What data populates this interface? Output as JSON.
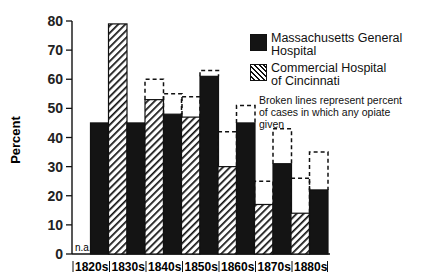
{
  "chart_data": {
    "type": "bar",
    "title": "",
    "xlabel": "",
    "ylabel": "Percent",
    "ylim": [
      0,
      80
    ],
    "yticks": [
      0,
      10,
      20,
      30,
      40,
      50,
      60,
      70,
      80
    ],
    "grid": false,
    "legend_position": "upper right",
    "categories": [
      "1820s",
      "1830s",
      "1840s",
      "1850s",
      "1860s",
      "1870s",
      "1880s"
    ],
    "series": [
      {
        "name": "Commercial Hospital of Cincinnati",
        "pattern": "hatched",
        "values": [
          null,
          79,
          53,
          47,
          30,
          17,
          14
        ],
        "any_opiate_values": [
          null,
          null,
          60,
          54,
          42,
          25,
          26
        ]
      },
      {
        "name": "Massachusetts General Hospital",
        "pattern": "solid-black",
        "values": [
          45,
          45,
          48,
          61,
          45,
          31,
          22
        ],
        "any_opiate_values": [
          null,
          null,
          55,
          63,
          51,
          43,
          35
        ]
      }
    ],
    "annotations": [
      "n.a.",
      "Broken lines represent percent of cases in which any opiate given"
    ]
  },
  "legend": {
    "mgh_line1": "Massachusetts General",
    "mgh_line2": "Hospital",
    "chc_line1": "Commercial Hospital",
    "chc_line2": "of Cincinnati"
  },
  "note": {
    "line1": "Broken lines represent percent",
    "line2": "of cases in which any opiate",
    "line3": "given"
  },
  "na_label": "n.a.",
  "y_axis_label": "Percent"
}
